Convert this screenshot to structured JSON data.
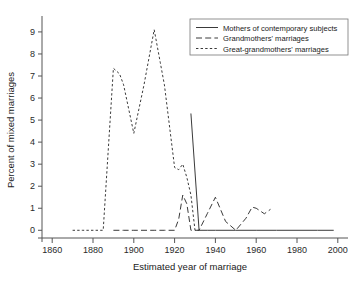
{
  "chart_data": {
    "type": "line",
    "title": "",
    "xlabel": "Estimated year of marriage",
    "ylabel": "Percent of mixed marriages",
    "xlim": [
      1855,
      2005
    ],
    "ylim": [
      -0.35,
      9.45
    ],
    "xticks": [
      1860,
      1880,
      1900,
      1920,
      1940,
      1960,
      1980,
      2000
    ],
    "xticklabels": [
      "1860",
      "1880",
      "1900",
      "1920",
      "1940",
      "1960",
      "1980",
      "2000"
    ],
    "yticks": [
      0,
      1,
      2,
      3,
      4,
      5,
      6,
      7,
      8,
      9
    ],
    "yticklabels": [
      "0",
      "1",
      "2",
      "3",
      "4",
      "5",
      "6",
      "7",
      "8",
      "9"
    ],
    "grid": false,
    "legend_position": "upper right",
    "series": [
      {
        "name": "Mothers of contemporary subjects",
        "linestyle": "solid",
        "color": "#3a3a3a",
        "x": [
          1928,
          1932,
          1936,
          1940,
          1950,
          1960,
          1970,
          1980,
          1990,
          1998
        ],
        "y": [
          5.3,
          0.0,
          0.0,
          0.0,
          0.0,
          0.0,
          0.0,
          0.0,
          0.0,
          0.0
        ]
      },
      {
        "name": "Grandmothers' marriages",
        "linestyle": "dashed",
        "color": "#3a3a3a",
        "x": [
          1890,
          1895,
          1900,
          1905,
          1910,
          1915,
          1920,
          1922,
          1924,
          1926,
          1928,
          1930,
          1932,
          1936,
          1940,
          1945,
          1950,
          1955,
          1958,
          1960,
          1964,
          1967
        ],
        "y": [
          0.0,
          0.0,
          0.0,
          0.0,
          0.0,
          0.0,
          0.0,
          0.5,
          1.6,
          1.2,
          0.0,
          0.0,
          0.0,
          0.75,
          1.5,
          0.4,
          0.0,
          0.55,
          1.05,
          1.0,
          0.75,
          0.95
        ]
      },
      {
        "name": "Great-grandmothers' marriages",
        "linestyle": "dotted",
        "color": "#3a3a3a",
        "x": [
          1870,
          1875,
          1880,
          1885,
          1890,
          1893,
          1895,
          1900,
          1905,
          1910,
          1913,
          1915,
          1920,
          1922,
          1924,
          1926,
          1928,
          1930,
          1932
        ],
        "y": [
          0.0,
          0.0,
          0.0,
          0.0,
          7.35,
          7.1,
          6.6,
          4.4,
          6.6,
          9.1,
          7.6,
          6.6,
          2.85,
          2.75,
          3.0,
          2.4,
          1.6,
          0.0,
          0.0
        ]
      }
    ]
  },
  "legend": {
    "entries": [
      {
        "label": "Mothers of contemporary subjects",
        "style": "solid"
      },
      {
        "label": "Grandmothers' marriages",
        "style": "dashed"
      },
      {
        "label": "Great-grandmothers' marriages",
        "style": "dotted"
      }
    ]
  }
}
